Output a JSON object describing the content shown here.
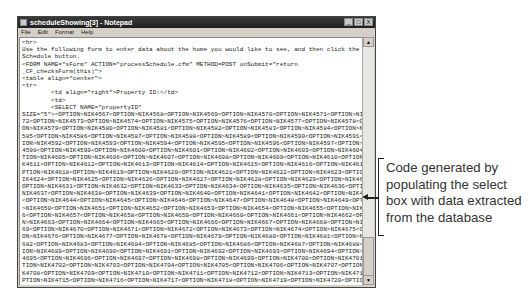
{
  "window": {
    "title": "scheduleShowing[3] - Notepad",
    "controls": [
      "_",
      "□",
      "X"
    ]
  },
  "menu": [
    "File",
    "Edit",
    "Format",
    "Help"
  ],
  "editor": {
    "lines": [
      "<hr>",
      "Use the following form to enter data about the home you would like to see, and then click the",
      "Schedule button.",
      "<FORM NAME=\"sForm\" ACTION=\"processSchedule.cfm\" METHOD=POST onSubmit=\"return",
      "_CF_checksForm(this)\">",
      "<table align=\"center\">",
      "<tr>",
      "        <td align=\"right\">Property ID:</td>",
      "        <td>",
      "        <SELECT NAME=\"propertyID\"",
      "SIZE=\"5\"><OPTION>NIK4567<OPTION>NIK4568<OPTION>NIK4569<OPTION>NIK4570<OPTION>NIK4571<OPTION>NIK45",
      "72<OPTION>NIK4573<OPTION>NIK4574<OPTION>NIK4575<OPTION>NIK4576<OPTION>NIK4577<OPTION>NIK4578<OPTI",
      "ON>NIK4579<OPTION>NIK4580<OPTION>NIK4581<OPTION>NIK4582<OPTION>NIK4583<OPTION>NIK4584<OPTION>NIK4",
      "585<OPTION>NIK4586<OPTION>NIK4587<OPTION>NIK4588<OPTION>NIK4589<OPTION>NIK4590<OPTION>NIK4591<OPT",
      "ION>NIK4592<OPTION>NIK4593<OPTION>NIK4594<OPTION>NIK4595<OPTION>NIK4596<OPTION>NIK4597<OPTION>NIK",
      "4598<OPTION>NIK4599<OPTION>NIK4600<OPTION>NIK4601<OPTION>NIK4602<OPTION>NIK4603<OPTION>NIK4604<OP",
      "TION>NIK4605<OPTION>NIK4606<OPTION>NIK4607<OPTION>NIK4608<OPTION>NIK4609<OPTION>NIK4610<OPTION>NI",
      "K4611<OPTION>NIK4612<OPTION>NIK4613<OPTION>NIK4614<OPTION>NIK4615<OPTION>NIK4616<OPTION>NIK4617<O",
      "PTION>NIK4618<OPTION>NIK4619<OPTION>NIK4620<OPTION>NIK4621<OPTION>NIK4622<OPTION>NIK4623<OPTION>N",
      "IK4624<OPTION>NIK4625<OPTION>NIK4626<OPTION>NIK4627<OPTION>NIK4628<OPTION>NIK4629<OPTION>NIK4630<",
      "OPTION>NIK4631<OPTION>NIK4632<OPTION>NIK4633<OPTION>NIK4634<OPTION>NIK4635<OPTION>NIK4636<OPTION>",
      "NIK4637<OPTION>NIK4638<OPTION>NIK4639<OPTION>NIK4640<OPTION>NIK4641<OPTION>NIK4642<OPTION>NIK4643",
      "<OPTION>NIK4644<OPTION>NIK4645<OPTION>NIK4646<OPTION>NIK4647<OPTION>NIK4648<OPTION>NIK4649<OPTION",
      ">NIK4650<OPTION>NIK4651<OPTION>NIK4652<OPTION>NIK4653<OPTION>NIK4654<OPTION>NIK4655<OPTION>NIK465",
      "6<OPTION>NIK4657<OPTION>NIK4658<OPTION>NIK4659<OPTION>NIK4660<OPTION>NIK4661<OPTION>NIK4662<OPTIO",
      "N>NIK4663<OPTION>NIK4664<OPTION>NIK4665<OPTION>NIK4666<OPTION>NIK4667<OPTION>NIK4668<OPTION>NIK46",
      "69<OPTION>NIK4670<OPTION>NIK4671<OPTION>NIK4672<OPTION>NIK4673<OPTION>NIK4674<OPTION>NIK4675<OPTI",
      "ON>NIK4676<OPTION>NIK4677<OPTION>NIK4678<OPTION>NIK4679<OPTION>NIK4680<OPTION>NIK4681<OPTION>NIK4",
      "682<OPTION>NIK4683<OPTION>NIK4684<OPTION>NIK4685<OPTION>NIK4686<OPTION>NIK4687<OPTION>NIK4688<OPT",
      "ION>NIK4689<OPTION>NIK4690<OPTION>NIK4691<OPTION>NIK4692<OPTION>NIK4693<OPTION>NIK4694<OPTION>NIK",
      "4695<OPTION>NIK4696<OPTION>NIK4697<OPTION>NIK4698<OPTION>NIK4699<OPTION>NIK4700<OPTION>NIK4701<OP",
      "TION>NIK4702<OPTION>NIK4703<OPTION>NIK4704<OPTION>NIK4705<OPTION>NIK4706<OPTION>NIK4707<OPTION>NI",
      "K4708<OPTION>NIK4709<OPTION>NIK4710<OPTION>NIK4711<OPTION>NIK4712<OPTION>NIK4713<OPTION>NIK4714<O",
      "PTION>NIK4715<OPTION>NIK4716<OPTION>NIK4717<OPTION>NIK4718<OPTION>NIK4719<OPTION>NIK4720<OPTION>N"
    ]
  },
  "scrollbar": {
    "up": "▲",
    "down": "▼"
  },
  "callout": {
    "text": "Code generated by populating the select box with data extracted from the database"
  }
}
